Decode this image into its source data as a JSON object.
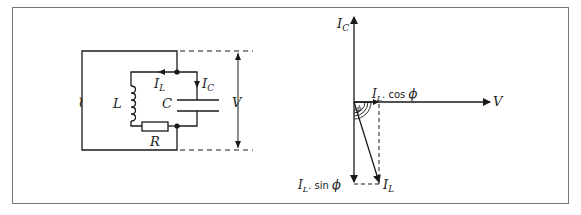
{
  "figure": {
    "circuit": {
      "source_symbol": "~",
      "inductor_label": "L",
      "capacitor_label": "C",
      "resistor_label": "R",
      "voltage_label": "V",
      "inductor_current_label": "I",
      "inductor_current_sub": "L",
      "capacitor_current_label": "I",
      "capacitor_current_sub": "C"
    },
    "phasor": {
      "ic_label": "I",
      "ic_sub": "C",
      "v_label": "V",
      "il_label": "I",
      "il_sub": "L",
      "cos_label_main": "I",
      "cos_label_sub": "L",
      "cos_label_rest": ". cos ",
      "cos_label_phi": "ϕ",
      "sin_label_main": "I",
      "sin_label_sub": "L",
      "sin_label_rest": ". sin ",
      "sin_label_phi": "ϕ",
      "angle_label": "ϕ"
    },
    "colors": {
      "line": "#1a1a1a",
      "frame": "#777777",
      "background": "#ffffff"
    }
  }
}
